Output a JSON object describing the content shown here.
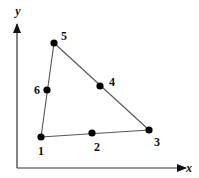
{
  "diagram": {
    "type": "triangular-element",
    "axes": {
      "x": {
        "label": "x",
        "from": [
          17,
          168
        ],
        "to": [
          186,
          168
        ],
        "label_pos": [
          189,
          172
        ]
      },
      "y": {
        "label": "y",
        "from": [
          17,
          168
        ],
        "to": [
          17,
          24
        ],
        "label_pos": [
          18,
          15
        ]
      }
    },
    "nodes": [
      {
        "id": "1",
        "label": "1",
        "x": 41,
        "y": 137,
        "label_x": 41,
        "label_y": 155
      },
      {
        "id": "2",
        "label": "2",
        "x": 92,
        "y": 133,
        "label_x": 97,
        "label_y": 151
      },
      {
        "id": "3",
        "label": "3",
        "x": 149,
        "y": 130,
        "label_x": 157,
        "label_y": 146
      },
      {
        "id": "4",
        "label": "4",
        "x": 100,
        "y": 86,
        "label_x": 112,
        "label_y": 86
      },
      {
        "id": "5",
        "label": "5",
        "x": 54,
        "y": 43,
        "label_x": 64,
        "label_y": 40
      },
      {
        "id": "6",
        "label": "6",
        "x": 47,
        "y": 90,
        "label_x": 37,
        "label_y": 94
      }
    ],
    "edges": [
      {
        "from": "1",
        "to": "3"
      },
      {
        "from": "3",
        "to": "5"
      },
      {
        "from": "5",
        "to": "1"
      }
    ],
    "colors": {
      "line": "#555555",
      "node": "#000000",
      "axis": "#333333"
    }
  }
}
